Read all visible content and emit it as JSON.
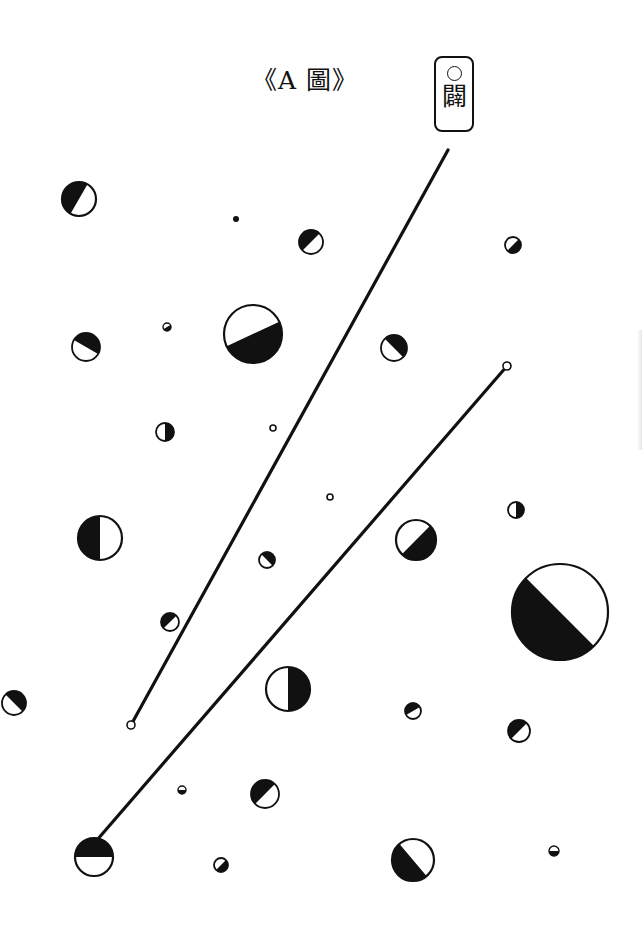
{
  "figure": {
    "title": "《A 圖》",
    "label": {
      "symbol": "○",
      "character": "闢"
    }
  },
  "style": {
    "ink": "#111111",
    "paper": "#ffffff"
  },
  "lines": [
    {
      "name": "line-1",
      "x1": 448,
      "y1": 150,
      "x2": 131,
      "y2": 725,
      "start_marker": "none",
      "end_marker": "open-circle"
    },
    {
      "name": "line-2",
      "x1": 507,
      "y1": 366,
      "x2": 97,
      "y2": 840,
      "start_marker": "open-circle",
      "end_marker": "none"
    }
  ],
  "circles": [
    {
      "cx": 79,
      "cy": 199,
      "r": 17,
      "dark_angle": 210
    },
    {
      "cx": 236,
      "cy": 219,
      "r": 3,
      "dark_angle": "solid"
    },
    {
      "cx": 311,
      "cy": 242,
      "r": 12,
      "dark_angle": 225
    },
    {
      "cx": 513,
      "cy": 245,
      "r": 8,
      "dark_angle": 45
    },
    {
      "cx": 86,
      "cy": 347,
      "r": 14,
      "dark_angle": 300
    },
    {
      "cx": 167,
      "cy": 327,
      "r": 4,
      "dark_angle": 60
    },
    {
      "cx": 253,
      "cy": 334,
      "r": 29,
      "dark_angle": 65
    },
    {
      "cx": 394,
      "cy": 348,
      "r": 13,
      "dark_angle": 315
    },
    {
      "cx": 165,
      "cy": 432,
      "r": 9,
      "dark_angle": 0
    },
    {
      "cx": 273,
      "cy": 428,
      "r": 3,
      "dark_angle": "ring"
    },
    {
      "cx": 100,
      "cy": 538,
      "r": 22,
      "dark_angle": 180
    },
    {
      "cx": 330,
      "cy": 497,
      "r": 3,
      "dark_angle": "ring"
    },
    {
      "cx": 416,
      "cy": 540,
      "r": 20,
      "dark_angle": 45
    },
    {
      "cx": 516,
      "cy": 510,
      "r": 8,
      "dark_angle": 0
    },
    {
      "cx": 267,
      "cy": 560,
      "r": 8,
      "dark_angle": 315
    },
    {
      "cx": 560,
      "cy": 612,
      "r": 48,
      "dark_angle": 135
    },
    {
      "cx": 170,
      "cy": 622,
      "r": 9,
      "dark_angle": 225
    },
    {
      "cx": 14,
      "cy": 703,
      "r": 12,
      "dark_angle": 315
    },
    {
      "cx": 288,
      "cy": 689,
      "r": 22,
      "dark_angle": 0
    },
    {
      "cx": 413,
      "cy": 711,
      "r": 8,
      "dark_angle": 240
    },
    {
      "cx": 519,
      "cy": 731,
      "r": 11,
      "dark_angle": 225
    },
    {
      "cx": 182,
      "cy": 790,
      "r": 4,
      "dark_angle": 90
    },
    {
      "cx": 265,
      "cy": 794,
      "r": 14,
      "dark_angle": 225
    },
    {
      "cx": 94,
      "cy": 857,
      "r": 19,
      "dark_angle": 270
    },
    {
      "cx": 221,
      "cy": 865,
      "r": 7,
      "dark_angle": 45
    },
    {
      "cx": 413,
      "cy": 860,
      "r": 21,
      "dark_angle": 140
    },
    {
      "cx": 554,
      "cy": 851,
      "r": 5,
      "dark_angle": 90
    }
  ]
}
